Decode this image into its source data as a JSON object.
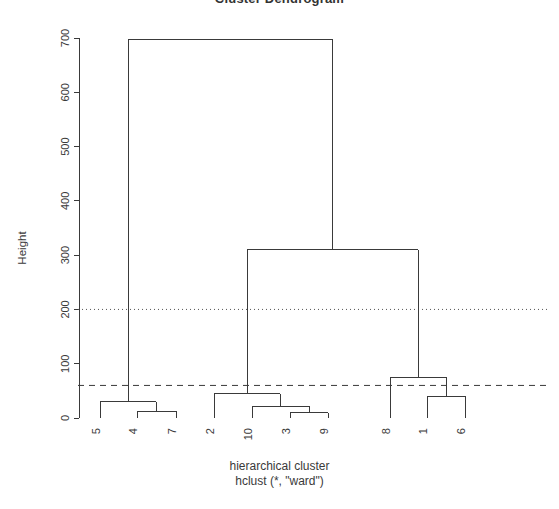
{
  "title": "Cluster Dendrogram",
  "axes": {
    "ylabel": "Height",
    "xlabel_line1": "hierarchical cluster",
    "xlabel_line2": "hclust (*, \"ward\")",
    "yticks": [
      0,
      100,
      200,
      300,
      400,
      500,
      600,
      700
    ],
    "ytick_labels": [
      "0",
      "100",
      "200",
      "300",
      "400",
      "500",
      "600",
      "700"
    ]
  },
  "colors": {
    "line": "#3a3a3a",
    "axis": "#3a3a3a",
    "background": "#ffffff",
    "dotted_ref": "#555555",
    "dashed_ref": "#3a3a3a"
  },
  "reference_lines": [
    {
      "name": "dotted-cut-200",
      "height": 200,
      "style": "dotted"
    },
    {
      "name": "dashed-cut-60",
      "height": 60,
      "style": "dashed"
    }
  ],
  "chart_data": {
    "type": "dendrogram",
    "title": "Cluster Dendrogram",
    "xlabel": "hierarchical cluster\nhclust (*, \"ward\")",
    "ylabel": "Height",
    "ylim": [
      0,
      700
    ],
    "grid": false,
    "legend": "none",
    "leaf_order": [
      "5",
      "4",
      "7",
      "2",
      "10",
      "3",
      "9",
      "8",
      "1",
      "6"
    ],
    "leaf_positions": [
      100,
      137,
      176,
      214,
      252,
      290,
      328,
      390,
      427,
      465
    ],
    "merges": [
      {
        "id": "m1",
        "left": "4",
        "right": "7",
        "height": 12,
        "x": 156
      },
      {
        "id": "m2",
        "left": "5",
        "right": "m1",
        "height": 30,
        "x": 128
      },
      {
        "id": "m3",
        "left": "3",
        "right": "9",
        "height": 10,
        "x": 309
      },
      {
        "id": "m4",
        "left": "10",
        "right": "m3",
        "height": 22,
        "x": 280
      },
      {
        "id": "m5",
        "left": "2",
        "right": "m4",
        "height": 45,
        "x": 247
      },
      {
        "id": "m6",
        "left": "1",
        "right": "6",
        "height": 40,
        "x": 446
      },
      {
        "id": "m7",
        "left": "8",
        "right": "m6",
        "height": 75,
        "x": 418
      },
      {
        "id": "m8",
        "left": "m5",
        "right": "m7",
        "height": 310,
        "x": 332
      },
      {
        "id": "m9",
        "left": "m2",
        "right": "m8",
        "height": 698,
        "x": 230
      }
    ],
    "merge_heights": [
      12,
      30,
      10,
      22,
      45,
      40,
      75,
      310,
      698
    ],
    "reference_line_heights": [
      200,
      60
    ],
    "clusters_at_cut_200": [
      [
        "5",
        "4",
        "7"
      ],
      [
        "2",
        "10",
        "3",
        "9",
        "8",
        "1",
        "6"
      ]
    ],
    "clusters_at_cut_60": [
      [
        "5",
        "4",
        "7"
      ],
      [
        "2",
        "10",
        "3",
        "9"
      ],
      [
        "8",
        "1",
        "6"
      ]
    ]
  }
}
